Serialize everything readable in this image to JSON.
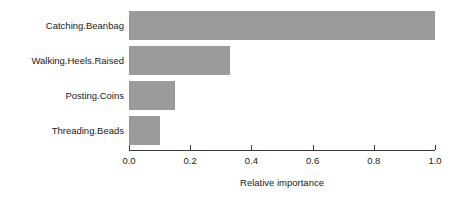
{
  "chart_data": {
    "type": "bar",
    "orientation": "horizontal",
    "title": "",
    "subtitle": "",
    "xlabel": "Relative importance",
    "ylabel": "",
    "categories": [
      "Catching.Beanbag",
      "Walking.Heels.Raised",
      "Posting.Coins",
      "Threading.Beads"
    ],
    "values": [
      1.0,
      0.33,
      0.15,
      0.1
    ],
    "xlim": [
      0.0,
      1.0
    ],
    "xticks": [
      "0.0",
      "0.2",
      "0.4",
      "0.6",
      "0.8",
      "1.0"
    ],
    "xtick_values": [
      0.0,
      0.2,
      0.4,
      0.6,
      0.8,
      1.0
    ],
    "grid": false,
    "legend": null,
    "legend_position": "none",
    "bar_color": "#9b9b9b",
    "axis_color": "#3c3c3c",
    "text_color": "#1a1a1a",
    "background": "#ffffff",
    "annotations": []
  }
}
